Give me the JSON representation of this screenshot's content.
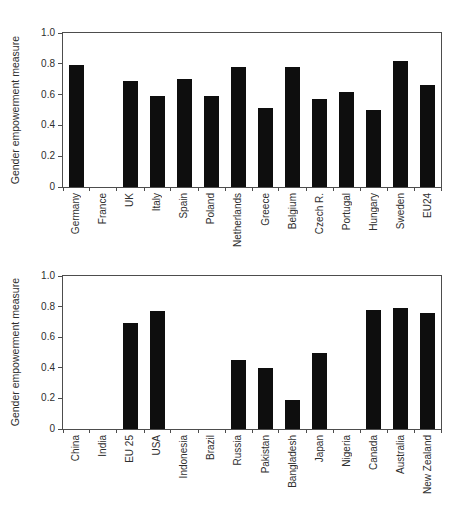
{
  "figure": {
    "background_color": "#ffffff",
    "bar_color": "#0e0e0e",
    "frame_color": "#4d4d4d",
    "text_color": "#2e2e2e"
  },
  "chart_data": [
    {
      "type": "bar",
      "title": "",
      "xlabel": "",
      "ylabel": "Gender empowerment measure",
      "ylim": [
        0,
        1.0
      ],
      "ytick_labels": [
        "0",
        "0.2",
        "0.4",
        "0.6",
        "0.8",
        "1.0"
      ],
      "grid": false,
      "legend": "none",
      "x_label_rotation": "vertical-bottom-to-top",
      "categories": [
        "Germany",
        "France",
        "UK",
        "Italy",
        "Spain",
        "Poland",
        "Netherlands",
        "Greece",
        "Belgium",
        "Czech R.",
        "Portugal",
        "Hungary",
        "Sweden",
        "EU24"
      ],
      "values": [
        0.79,
        0,
        0.69,
        0.59,
        0.7,
        0.59,
        0.78,
        0.51,
        0.78,
        0.57,
        0.62,
        0.5,
        0.82,
        0.66
      ]
    },
    {
      "type": "bar",
      "title": "",
      "xlabel": "",
      "ylabel": "Gender empowerment measure",
      "ylim": [
        0,
        1.0
      ],
      "ytick_labels": [
        "0",
        "0.2",
        "0.4",
        "0.6",
        "0.8",
        "1.0"
      ],
      "grid": false,
      "legend": "none",
      "x_label_rotation": "vertical-bottom-to-top",
      "categories": [
        "China",
        "India",
        "EU 25",
        "USA",
        "Indonesia",
        "Brazil",
        "Russia",
        "Pakistan",
        "Bangladesh",
        "Japan",
        "Nigeria",
        "Canada",
        "Australia",
        "New Zealand"
      ],
      "values": [
        0,
        0,
        0.69,
        0.77,
        0,
        0,
        0.45,
        0.4,
        0.19,
        0.5,
        0,
        0.78,
        0.79,
        0.76
      ]
    }
  ]
}
